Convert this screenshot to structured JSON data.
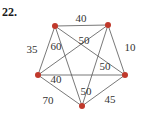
{
  "problem": {
    "number": "22."
  },
  "graph": {
    "type": "complete-weighted-graph",
    "vertex_color": "#c0392b",
    "edge_color": "#555555",
    "vertices": [
      {
        "id": "A",
        "position": "top-left"
      },
      {
        "id": "B",
        "position": "top-right"
      },
      {
        "id": "C",
        "position": "right"
      },
      {
        "id": "D",
        "position": "bottom"
      },
      {
        "id": "E",
        "position": "left"
      }
    ],
    "edges": [
      {
        "from": "A",
        "to": "B",
        "weight": "40"
      },
      {
        "from": "B",
        "to": "C",
        "weight": "10"
      },
      {
        "from": "C",
        "to": "D",
        "weight": "45"
      },
      {
        "from": "D",
        "to": "E",
        "weight": "70"
      },
      {
        "from": "E",
        "to": "A",
        "weight": "35"
      },
      {
        "from": "A",
        "to": "D",
        "weight": "60"
      },
      {
        "from": "B",
        "to": "E",
        "weight": "50"
      },
      {
        "from": "A",
        "to": "C",
        "weight": "50"
      },
      {
        "from": "E",
        "to": "C",
        "weight": "40"
      },
      {
        "from": "B",
        "to": "D",
        "weight": "50"
      }
    ]
  }
}
